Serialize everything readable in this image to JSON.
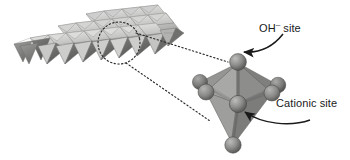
{
  "figure": {
    "background_color": "#ffffff"
  },
  "labels": {
    "oh_site": {
      "text_main": "OH",
      "text_charge": "–",
      "text_tail": "site",
      "full": "OH– site"
    },
    "cationic_site": {
      "text": "Cationic site"
    }
  },
  "icons": {
    "oh_arrow": "curved-arrow-icon",
    "cationic_arrow": "curved-arrow-icon",
    "highlight_ellipse": "dashed-ellipse-icon",
    "connector_upper": "dotted-line-icon",
    "connector_lower": "dotted-line-icon"
  },
  "colors": {
    "face_light": "#d8d8d6",
    "face_mid": "#b4b4b2",
    "face_dark": "#8e8e8c",
    "face_darker": "#6e6e6c",
    "sphere_light": "#a9a9a7",
    "sphere_mid": "#8a8a88",
    "sphere_dark": "#5e5e5c",
    "outline": "#6b6b69",
    "ink": "#1a1a1a",
    "lattice_edge": "#7a7a78"
  },
  "structure": {
    "sheet": {
      "name": "octahedral-sheet",
      "rows": 3,
      "columns": 6,
      "description": "Edge-sharing octahedra forming a brucite-like layer in oblique projection"
    },
    "magnified_octahedron": {
      "name": "single-octahedron",
      "vertex_count": 6,
      "vertex_label": "OH– site",
      "center_label": "Cationic site",
      "center_sphere_count": 1
    }
  }
}
